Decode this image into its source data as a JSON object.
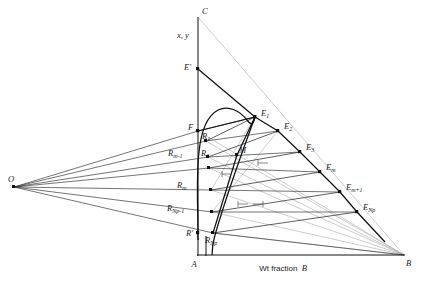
{
  "figure": {
    "type": "ternary-extraction-diagram",
    "title": "",
    "background": "#ffffff",
    "ink": "#1a1a1a",
    "light_ink": "#8a8a8a"
  },
  "axes": {
    "vertical_label": "x, y",
    "horizontal_label_prefix": "Wt fraction ",
    "horizontal_label_component": "B"
  },
  "vertices": {
    "A": {
      "label": "A",
      "x": 198,
      "y": 255
    },
    "B": {
      "label": "B",
      "x": 404,
      "y": 255
    },
    "C": {
      "label": "C",
      "x": 198,
      "y": 17
    },
    "O": {
      "label": "O",
      "x": 14,
      "y": 187
    }
  },
  "points": {
    "E_prime": {
      "label": "E'",
      "x": 198,
      "y": 69
    },
    "F": {
      "label": "F",
      "x": 198,
      "y": 131
    },
    "M": {
      "label": "M",
      "x": 237,
      "y": 155
    },
    "R_prime": {
      "label": "R'",
      "x": 198,
      "y": 233
    }
  },
  "extract_stages": [
    {
      "label": "E",
      "sub": "1",
      "x": 255,
      "y": 117
    },
    {
      "label": "E",
      "sub": "2",
      "x": 278,
      "y": 131
    },
    {
      "label": "E",
      "sub": "3",
      "x": 300,
      "y": 152
    },
    {
      "label": "E",
      "sub": "m",
      "x": 320,
      "y": 172
    },
    {
      "label": "E",
      "sub": "m+1",
      "x": 340,
      "y": 192
    },
    {
      "label": "E",
      "sub": "Np",
      "x": 357,
      "y": 212
    }
  ],
  "raffinate_stages": [
    {
      "label": "R",
      "sub": "1",
      "x": 206,
      "y": 141
    },
    {
      "label": "R",
      "sub": "2",
      "x": 208,
      "y": 157
    },
    {
      "label": "R",
      "sub": "m-1",
      "x": 209,
      "y": 168
    },
    {
      "label": "R",
      "sub": "m",
      "x": 211,
      "y": 190
    },
    {
      "label": "R",
      "sub": "Np-1",
      "x": 212,
      "y": 212
    },
    {
      "label": "R",
      "sub": "Np",
      "x": 213,
      "y": 233
    }
  ],
  "label_offsets": {
    "E_1": {
      "dx": 6,
      "dy": -3
    },
    "E_2": {
      "dx": 6,
      "dy": -3
    },
    "E_3": {
      "dx": 6,
      "dy": -3
    },
    "E_m": {
      "dx": 6,
      "dy": -3
    },
    "E_m1": {
      "dx": 6,
      "dy": -3
    },
    "E_Np": {
      "dx": 6,
      "dy": -3
    },
    "R_1": {
      "dx": -2,
      "dy": -3
    },
    "R_2": {
      "dx": -4,
      "dy": -3
    },
    "R_m1": {
      "dx": -32,
      "dy": -2
    },
    "R_m": {
      "dx": -25,
      "dy": 0
    },
    "R_Np1": {
      "dx": -36,
      "dy": 0
    },
    "R_Np": {
      "dx": 2,
      "dy": 10
    }
  },
  "tick_groups": [
    {
      "name": "ellipsis-upper",
      "x": 262,
      "y": 167,
      "count": 1
    },
    {
      "name": "ellipsis-mid",
      "x": 226,
      "y": 176,
      "count": 1
    },
    {
      "name": "ellipsis-lower",
      "x": 245,
      "y": 206,
      "count": 2
    }
  ],
  "curve": {
    "name": "binodal-solubility-curve",
    "plait_region": "left-hump"
  }
}
